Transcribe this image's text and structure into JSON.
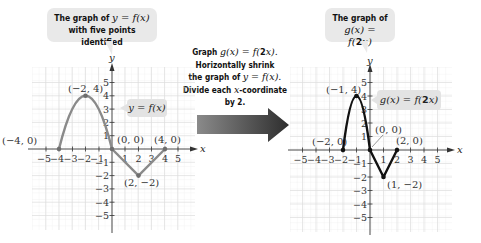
{
  "left_panel": {
    "callout": {
      "line1_prefix": "The graph of ",
      "line1_math": "y = f(x)",
      "line2": "with five points identified"
    },
    "function_label": "y = f(x)",
    "curve_color": "#8a8a8a",
    "points": [
      {
        "label": "(−4, 0)",
        "x": -4,
        "y": 0
      },
      {
        "label": "(−2, 4)",
        "x": -2,
        "y": 4
      },
      {
        "label": "(0, 0)",
        "x": 0,
        "y": 0
      },
      {
        "label": "(2, −2)",
        "x": 2,
        "y": -2
      },
      {
        "label": "(4, 0)",
        "x": 4,
        "y": 0
      }
    ]
  },
  "middle": {
    "line1_prefix": "Graph ",
    "line1_math_a": "g(x) = f(",
    "line1_bold": "2",
    "line1_math_b": "x).",
    "line2": "Horizontally shrink",
    "line3_prefix": "the graph of ",
    "line3_math": "y = f(x).",
    "line4_prefix": "Divide each ",
    "line4_math": "x",
    "line4_suffix": "-coordinate",
    "line5": "by 2.",
    "arrow_color_start": "#8a8a8a",
    "arrow_color_end": "#2e2e2e"
  },
  "right_panel": {
    "callout": {
      "line1": "The graph of",
      "line2_math_a": "g(x) = f(",
      "line2_bold": "2",
      "line2_math_b": "x)"
    },
    "function_label_a": "g(x) = f(",
    "function_label_bold": "2",
    "function_label_b": "x)",
    "curve_color": "#111111",
    "points": [
      {
        "label": "(−2, 0)",
        "x": -2,
        "y": 0
      },
      {
        "label": "(−1, 4)",
        "x": -1,
        "y": 4
      },
      {
        "label": "(0, 0)",
        "x": 0,
        "y": 0
      },
      {
        "label": "(1, −2)",
        "x": 1,
        "y": -2
      },
      {
        "label": "(2, 0)",
        "x": 2,
        "y": 0
      }
    ]
  },
  "axes": {
    "x_label": "x",
    "y_label": "y",
    "x_ticks": [
      "−5",
      "−4",
      "−3",
      "−2",
      "−1",
      "1",
      "2",
      "3",
      "4",
      "5"
    ],
    "y_ticks_pos": [
      "1",
      "2",
      "3",
      "4",
      "5"
    ],
    "y_ticks_neg": [
      "−1",
      "−2",
      "−3",
      "−4",
      "−5"
    ],
    "range": [
      -5,
      5
    ],
    "grid_color": "#e2e2e2"
  }
}
